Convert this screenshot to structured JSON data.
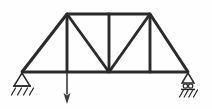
{
  "figure": {
    "type": "structural-truss-diagram",
    "background_color": "#fefefe",
    "line_color": "#2b2b2b",
    "load_color": "#3a3a3a"
  },
  "geometry": {
    "units": "px",
    "bottom_chord_y": 72,
    "top_chord_y": 14,
    "left_support_x": 22,
    "right_support_x": 188,
    "left_apex_x": 67,
    "right_apex_x": 150,
    "center_x": 109
  },
  "joints": [
    {
      "id": "A",
      "name": "left-support-joint",
      "x": 22,
      "y": 72
    },
    {
      "id": "B",
      "name": "bottom-left-panel-joint",
      "x": 67,
      "y": 72
    },
    {
      "id": "C",
      "name": "bottom-center-joint",
      "x": 109,
      "y": 72
    },
    {
      "id": "D",
      "name": "bottom-right-panel-joint",
      "x": 150,
      "y": 72
    },
    {
      "id": "E",
      "name": "right-support-joint",
      "x": 188,
      "y": 72
    },
    {
      "id": "F",
      "name": "top-left-apex-joint",
      "x": 67,
      "y": 14
    },
    {
      "id": "G",
      "name": "top-center-joint",
      "x": 109,
      "y": 14
    },
    {
      "id": "H",
      "name": "top-right-apex-joint",
      "x": 150,
      "y": 14
    }
  ],
  "members": [
    {
      "name": "bottom-chord",
      "kind": "chord",
      "x1": 22,
      "y1": 72,
      "x2": 188,
      "y2": 72
    },
    {
      "name": "top-chord",
      "kind": "chord",
      "x1": 67,
      "y1": 14,
      "x2": 150,
      "y2": 14
    },
    {
      "name": "left-end-diagonal",
      "kind": "chord",
      "x1": 22,
      "y1": 72,
      "x2": 67,
      "y2": 14
    },
    {
      "name": "right-end-diagonal",
      "kind": "chord",
      "x1": 150,
      "y1": 14,
      "x2": 188,
      "y2": 72
    },
    {
      "name": "left-vertical",
      "kind": "web",
      "x1": 67,
      "y1": 14,
      "x2": 67,
      "y2": 72
    },
    {
      "name": "center-vertical",
      "kind": "web",
      "x1": 109,
      "y1": 14,
      "x2": 109,
      "y2": 72
    },
    {
      "name": "right-vertical",
      "kind": "web",
      "x1": 150,
      "y1": 14,
      "x2": 150,
      "y2": 72
    },
    {
      "name": "left-inner-diagonal",
      "kind": "web",
      "x1": 67,
      "y1": 14,
      "x2": 109,
      "y2": 72
    },
    {
      "name": "right-inner-diagonal",
      "kind": "web",
      "x1": 109,
      "y1": 72,
      "x2": 150,
      "y2": 14
    }
  ],
  "supports": {
    "left": {
      "name": "pin-support",
      "type": "pinned",
      "apex_x": 22,
      "apex_y": 73,
      "base_y": 86,
      "half_width": 8,
      "hatch_count": 4,
      "hatch_y_top": 88,
      "hatch_y_bottom": 95
    },
    "right": {
      "name": "roller-support",
      "type": "roller",
      "apex_x": 188,
      "apex_y": 73,
      "base_y": 83,
      "half_width": 6,
      "roller_count": 2,
      "roller_radius": 2.2,
      "roller_y": 86,
      "hatch_count": 4,
      "hatch_y_top": 89,
      "hatch_y_bottom": 96
    }
  },
  "load": {
    "name": "point-load-arrow",
    "direction": "down",
    "x": 67,
    "y_start": 72,
    "y_end": 104,
    "head_width": 7,
    "head_length": 11,
    "label": ""
  }
}
